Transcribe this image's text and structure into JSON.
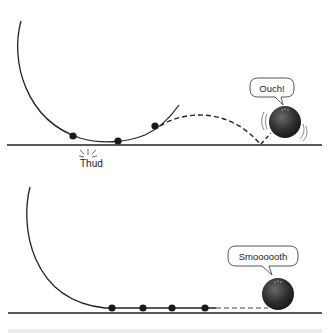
{
  "top_panel": {
    "speech": "Ouch!",
    "impact_label": "Thud",
    "ball_positions": [
      [
        73,
        136
      ],
      [
        118,
        141
      ],
      [
        155,
        126
      ]
    ]
  },
  "bottom_panel": {
    "speech": "Smoooooth",
    "ball_positions": [
      [
        112,
        308
      ],
      [
        143,
        308
      ],
      [
        172,
        308
      ],
      [
        205,
        308
      ]
    ]
  },
  "colors": {
    "line": "#222222",
    "ball": "#1a1a1a",
    "bowling_ball_dark": "#222222",
    "bowling_ball_light": "#666666",
    "bubble_stroke": "#444444",
    "bottom_band": "#ececec"
  }
}
